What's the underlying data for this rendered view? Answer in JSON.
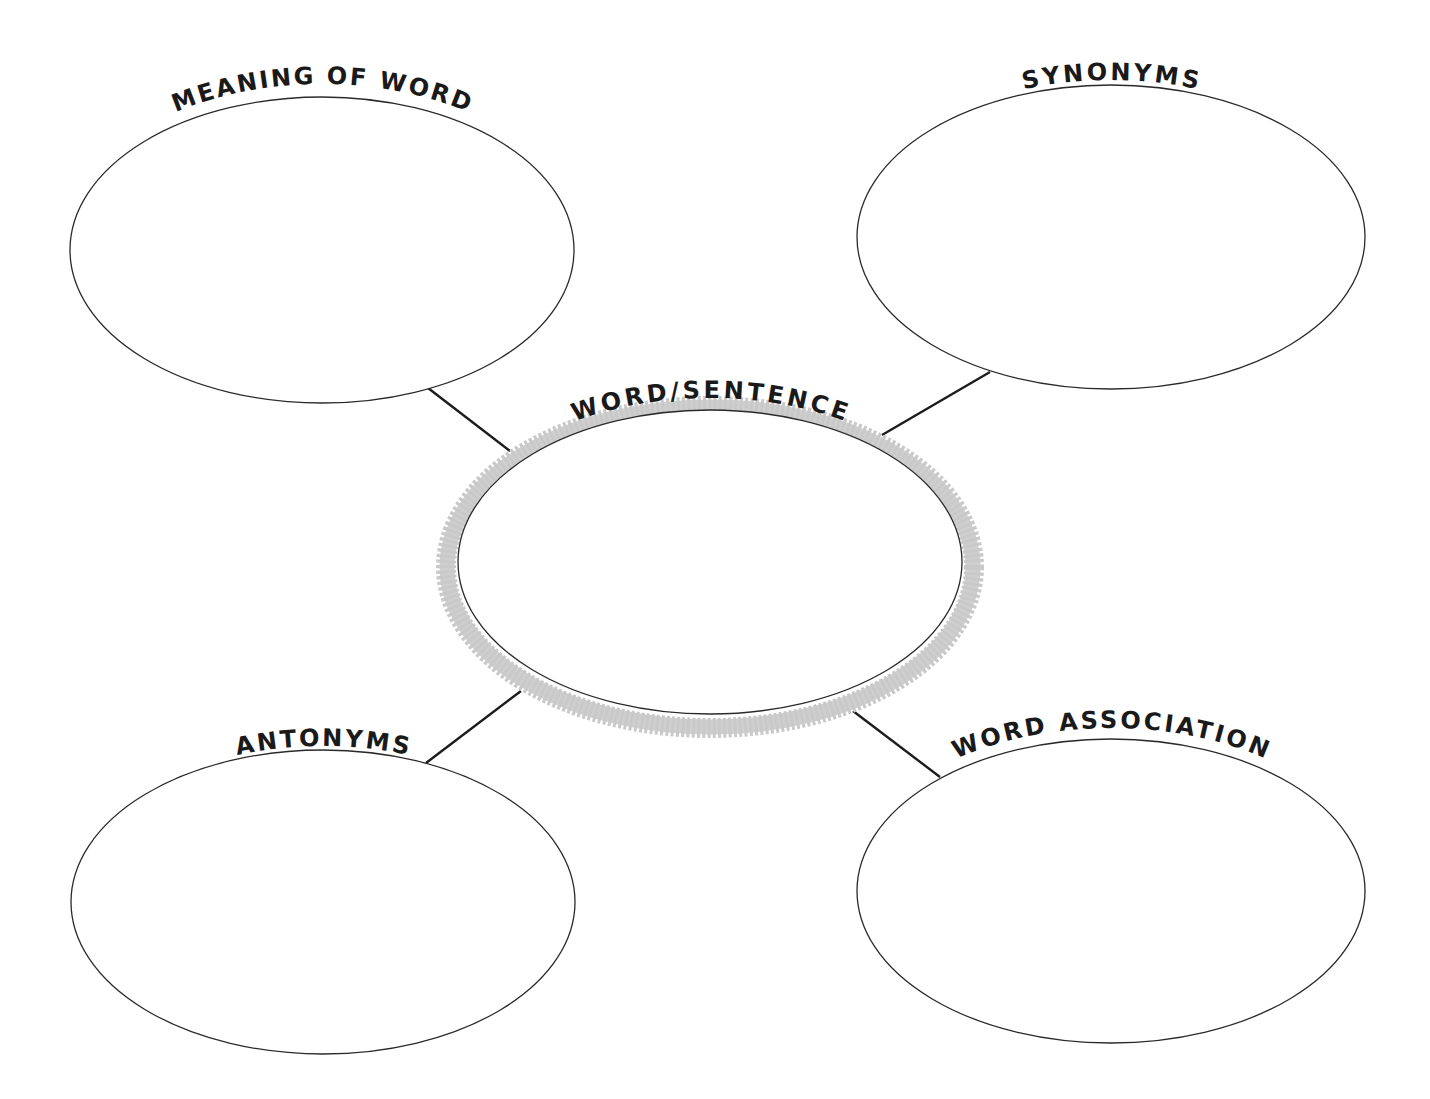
{
  "diagram": {
    "type": "word-web graphic organizer",
    "colors": {
      "background": "#ffffff",
      "outline": "#2a2a2a",
      "connector": "#1c1c1c",
      "center_ring": "#c9c9c9",
      "text": "#1a1a1a"
    },
    "center": {
      "label": "WORD/SENTENCE",
      "content": ""
    },
    "nodes": [
      {
        "id": "meaning",
        "label": "MEANING OF WORD",
        "position": "top-left",
        "content": ""
      },
      {
        "id": "synonyms",
        "label": "SYNONYMS",
        "position": "top-right",
        "content": ""
      },
      {
        "id": "antonyms",
        "label": "ANTONYMS",
        "position": "bottom-left",
        "content": ""
      },
      {
        "id": "association",
        "label": "WORD ASSOCIATION",
        "position": "bottom-right",
        "content": ""
      }
    ]
  }
}
